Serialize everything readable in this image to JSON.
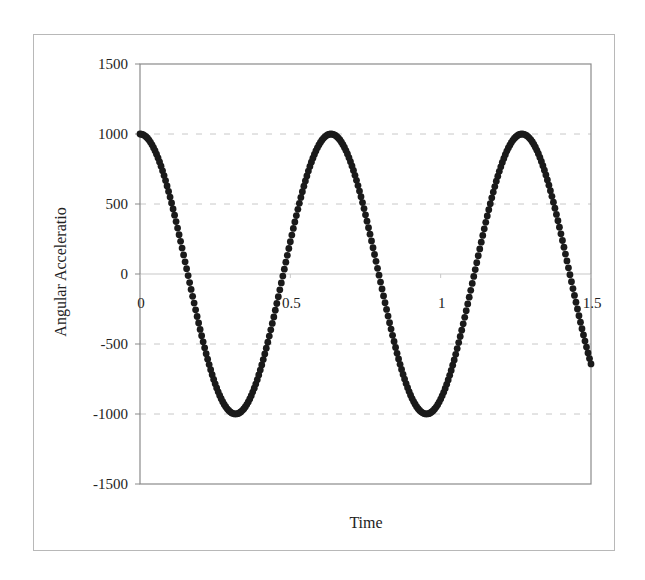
{
  "chart_data": {
    "type": "scatter",
    "title": "",
    "xlabel": "Time",
    "ylabel": "Angular Acceleration",
    "ylabel_visible_text": "Angular Acceleratio",
    "xlim": [
      0,
      1.5
    ],
    "ylim": [
      -1500,
      1500
    ],
    "x_ticks": [
      0,
      0.5,
      1,
      1.5
    ],
    "x_tick_labels": [
      "0",
      "0.5",
      "1",
      "1.5"
    ],
    "y_ticks": [
      1500,
      1000,
      500,
      0,
      -500,
      -1000,
      -1500
    ],
    "y_tick_labels": [
      "1500",
      "1000",
      "500",
      "0",
      "-500",
      "-1000",
      "-1500"
    ],
    "grid": {
      "horizontal_dashed": true,
      "vertical": false
    },
    "legend": "none",
    "series": [
      {
        "name": "Angular Acceleration",
        "marker": "filled-circle",
        "color": "#1a1a1a",
        "function": "1000*cos(9.89*t)",
        "amplitude": 1000,
        "omega": 9.89,
        "t_start": 0,
        "t_end": 1.5,
        "t_step": 0.005,
        "key_points": [
          {
            "x": 0,
            "y": 1000
          },
          {
            "x": 0.159,
            "y": 0
          },
          {
            "x": 0.318,
            "y": -1000
          },
          {
            "x": 0.476,
            "y": 0
          },
          {
            "x": 0.635,
            "y": 1000
          },
          {
            "x": 0.794,
            "y": 0
          },
          {
            "x": 0.953,
            "y": -1000
          },
          {
            "x": 1.112,
            "y": 0
          },
          {
            "x": 1.271,
            "y": 1000
          },
          {
            "x": 1.429,
            "y": 0
          },
          {
            "x": 1.5,
            "y": -640
          }
        ]
      }
    ]
  },
  "colors": {
    "frame_border": "#b8b8b8",
    "plot_border": "#8a8a8a",
    "gridline": "#c8c8c8",
    "marker": "#1a1a1a"
  }
}
